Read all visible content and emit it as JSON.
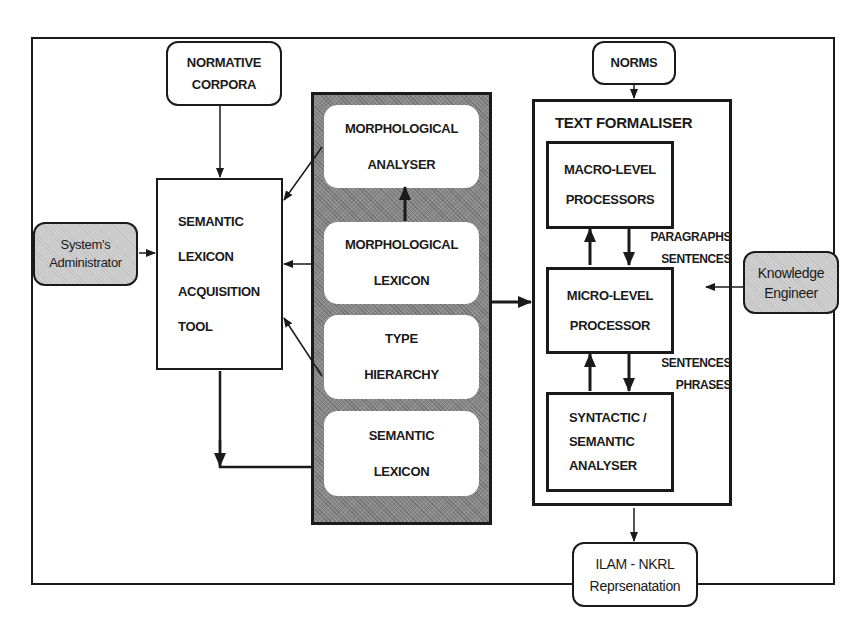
{
  "diagram": {
    "normative_corpora": {
      "lines": [
        "NORMATIVE",
        "CORPORA"
      ]
    },
    "norms": {
      "lines": [
        "NORMS"
      ]
    },
    "system_admin": {
      "lines": [
        "System's",
        "Administrator"
      ]
    },
    "knowledge_engineer": {
      "lines": [
        "Knowledge",
        "Engineer"
      ]
    },
    "acquisition_tool": {
      "lines": [
        "SEMANTIC",
        "LEXICON",
        "ACQUISITION",
        "TOOL"
      ]
    },
    "resource_panel": {
      "items": [
        {
          "lines": [
            "MORPHOLOGICAL",
            "ANALYSER"
          ]
        },
        {
          "lines": [
            "MORPHOLOGICAL",
            "LEXICON"
          ]
        },
        {
          "lines": [
            "TYPE",
            "HIERARCHY"
          ]
        },
        {
          "lines": [
            "SEMANTIC",
            "LEXICON"
          ]
        }
      ]
    },
    "text_formaliser": {
      "title": "TEXT FORMALISER",
      "macro": {
        "lines": [
          "MACRO-LEVEL",
          "PROCESSORS"
        ]
      },
      "micro": {
        "lines": [
          "MICRO-LEVEL",
          "PROCESSOR"
        ]
      },
      "syntactic": {
        "lines": [
          "SYNTACTIC /",
          "SEMANTIC",
          "ANALYSER"
        ]
      },
      "flow_labels": {
        "macro_to_micro": [
          "PARAGRAPHS",
          "SENTENCES"
        ],
        "micro_to_syntactic": [
          "SENTENCES",
          "PHRASES"
        ]
      }
    },
    "output": {
      "lines": [
        "ILAM - NKRL",
        "Reprsenatation"
      ]
    }
  }
}
